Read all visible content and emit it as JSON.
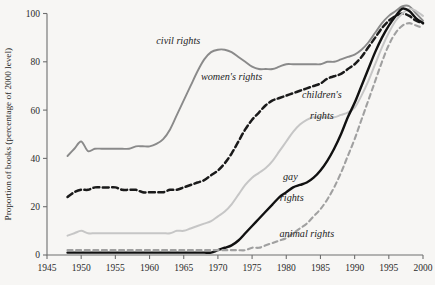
{
  "chart_data": {
    "type": "line",
    "title": "",
    "xlabel": "",
    "ylabel": "Proportion of books (percentage of 2000 level)",
    "xlim": [
      1945,
      2000
    ],
    "ylim": [
      0,
      100
    ],
    "xticks": [
      "1945",
      "1950",
      "1955",
      "1960",
      "1965",
      "1970",
      "1975",
      "1980",
      "1985",
      "1990",
      "1995",
      "2000"
    ],
    "yticks": [
      "0",
      "20",
      "40",
      "60",
      "80",
      "100"
    ],
    "grid": false,
    "legend_position": "inline-annotations",
    "series": [
      {
        "name": "civil rights",
        "style": "solid",
        "color": "#8a8a8a",
        "label_x": 1965,
        "label_y": 88,
        "x": [
          1948,
          1949,
          1950,
          1951,
          1952,
          1953,
          1954,
          1955,
          1956,
          1957,
          1958,
          1959,
          1960,
          1961,
          1962,
          1963,
          1964,
          1965,
          1966,
          1967,
          1968,
          1969,
          1970,
          1971,
          1972,
          1973,
          1974,
          1975,
          1976,
          1977,
          1978,
          1979,
          1980,
          1981,
          1982,
          1983,
          1984,
          1985,
          1986,
          1987,
          1988,
          1989,
          1990,
          1991,
          1992,
          1993,
          1994,
          1995,
          1996,
          1997,
          1998,
          1999,
          2000
        ],
        "y": [
          41,
          44,
          47,
          43,
          44,
          44,
          44,
          44,
          44,
          44,
          45,
          45,
          45,
          46,
          48,
          52,
          58,
          64,
          70,
          76,
          81,
          84,
          85,
          85,
          84,
          82,
          80,
          78,
          77,
          77,
          77,
          78,
          79,
          79,
          79,
          79,
          79,
          79,
          80,
          80,
          81,
          82,
          83,
          85,
          88,
          92,
          96,
          99,
          101,
          103,
          103,
          100,
          97
        ]
      },
      {
        "name": "women's rights",
        "style": "dashed",
        "color": "#1a1a1a",
        "label_x": 1971,
        "label_y": 73,
        "x": [
          1948,
          1949,
          1950,
          1951,
          1952,
          1953,
          1954,
          1955,
          1956,
          1957,
          1958,
          1959,
          1960,
          1961,
          1962,
          1963,
          1964,
          1965,
          1966,
          1967,
          1968,
          1969,
          1970,
          1971,
          1972,
          1973,
          1974,
          1975,
          1976,
          1977,
          1978,
          1979,
          1980,
          1981,
          1982,
          1983,
          1984,
          1985,
          1986,
          1987,
          1988,
          1989,
          1990,
          1991,
          1992,
          1993,
          1994,
          1995,
          1996,
          1997,
          1998,
          1999,
          2000
        ],
        "y": [
          24,
          26,
          27,
          27,
          28,
          28,
          28,
          28,
          27,
          27,
          27,
          26,
          26,
          26,
          26,
          27,
          27,
          28,
          29,
          30,
          31,
          33,
          35,
          38,
          42,
          47,
          52,
          56,
          59,
          62,
          64,
          65,
          66,
          67,
          68,
          69,
          70,
          71,
          73,
          74,
          75,
          77,
          79,
          82,
          86,
          90,
          94,
          97,
          99,
          100,
          99,
          97,
          96
        ]
      },
      {
        "name": "children's rights",
        "style": "solid",
        "color": "#c6c6c6",
        "label_x": 1985,
        "label_y": 65,
        "label_x2": 1985,
        "label_y2": 56,
        "x": [
          1948,
          1949,
          1950,
          1951,
          1952,
          1953,
          1954,
          1955,
          1956,
          1957,
          1958,
          1959,
          1960,
          1961,
          1962,
          1963,
          1964,
          1965,
          1966,
          1967,
          1968,
          1969,
          1970,
          1971,
          1972,
          1973,
          1974,
          1975,
          1976,
          1977,
          1978,
          1979,
          1980,
          1981,
          1982,
          1983,
          1984,
          1985,
          1986,
          1987,
          1988,
          1989,
          1990,
          1991,
          1992,
          1993,
          1994,
          1995,
          1996,
          1997,
          1998,
          1999,
          2000
        ],
        "y": [
          8,
          9,
          10,
          9,
          9,
          9,
          9,
          9,
          9,
          9,
          9,
          9,
          9,
          9,
          9,
          9,
          10,
          10,
          11,
          12,
          13,
          14,
          16,
          18,
          21,
          25,
          29,
          32,
          34,
          36,
          39,
          43,
          47,
          51,
          54,
          56,
          57,
          57,
          57,
          57,
          58,
          59,
          61,
          66,
          72,
          79,
          86,
          92,
          97,
          100,
          102,
          101,
          99
        ]
      },
      {
        "name": "gay rights",
        "style": "solid",
        "color": "#111111",
        "label_x": 1981,
        "label_y": 31,
        "label_x2": 1981,
        "label_y2": 22,
        "x": [
          1948,
          1949,
          1950,
          1951,
          1952,
          1953,
          1954,
          1955,
          1956,
          1957,
          1958,
          1959,
          1960,
          1961,
          1962,
          1963,
          1964,
          1965,
          1966,
          1967,
          1968,
          1969,
          1970,
          1971,
          1972,
          1973,
          1974,
          1975,
          1976,
          1977,
          1978,
          1979,
          1980,
          1981,
          1982,
          1983,
          1984,
          1985,
          1986,
          1987,
          1988,
          1989,
          1990,
          1991,
          1992,
          1993,
          1994,
          1995,
          1996,
          1997,
          1998,
          1999,
          2000
        ],
        "y": [
          1,
          1,
          1,
          1,
          1,
          1,
          1,
          1,
          1,
          1,
          1,
          1,
          1,
          1,
          1,
          1,
          1,
          1,
          1,
          1,
          1,
          1,
          2,
          3,
          4,
          6,
          9,
          12,
          15,
          18,
          21,
          24,
          26,
          28,
          29,
          30,
          32,
          35,
          39,
          44,
          50,
          57,
          63,
          70,
          77,
          84,
          90,
          95,
          99,
          102,
          101,
          98,
          96
        ]
      },
      {
        "name": "animal rights",
        "style": "dashed",
        "color": "#a0a0a0",
        "label_x": 1981,
        "label_y": 8,
        "x": [
          1948,
          1949,
          1950,
          1951,
          1952,
          1953,
          1954,
          1955,
          1956,
          1957,
          1958,
          1959,
          1960,
          1961,
          1962,
          1963,
          1964,
          1965,
          1966,
          1967,
          1968,
          1969,
          1970,
          1971,
          1972,
          1973,
          1974,
          1975,
          1976,
          1977,
          1978,
          1979,
          1980,
          1981,
          1982,
          1983,
          1984,
          1985,
          1986,
          1987,
          1988,
          1989,
          1990,
          1991,
          1992,
          1993,
          1994,
          1995,
          1996,
          1997,
          1998,
          1999,
          2000
        ],
        "y": [
          2,
          2,
          2,
          2,
          2,
          2,
          2,
          2,
          2,
          2,
          2,
          2,
          2,
          2,
          2,
          2,
          2,
          2,
          2,
          2,
          2,
          2,
          2,
          2,
          2,
          2,
          2,
          3,
          3,
          4,
          5,
          6,
          7,
          9,
          11,
          13,
          16,
          19,
          23,
          28,
          34,
          41,
          48,
          56,
          64,
          72,
          80,
          87,
          92,
          95,
          96,
          95,
          94
        ]
      }
    ]
  },
  "labels": {
    "civil_rights": "civil rights",
    "womens_rights": "women's rights",
    "childrens_rights_l1": "children's",
    "childrens_rights_l2": "rights",
    "gay_rights_l1": "gay",
    "gay_rights_l2": "rights",
    "animal_rights": "animal rights"
  }
}
